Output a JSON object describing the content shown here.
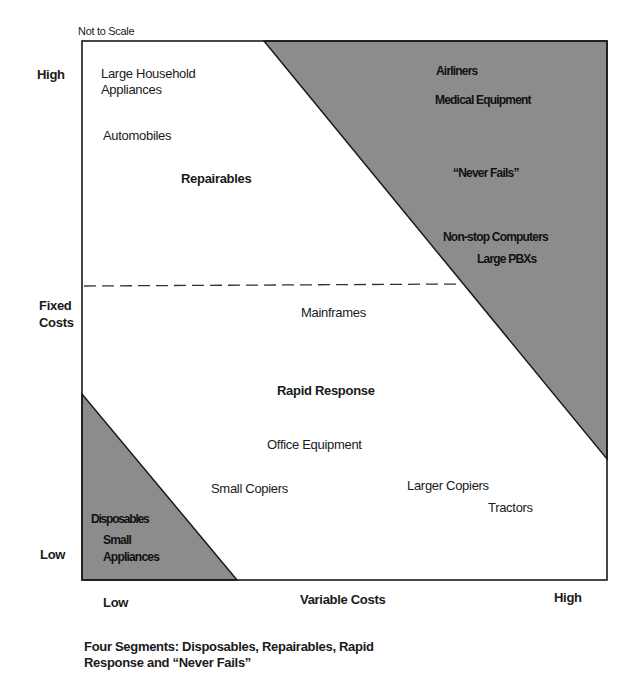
{
  "diagram": {
    "note": "Not to Scale",
    "y_axis": {
      "title_line1": "Fixed",
      "title_line2": "Costs",
      "high": "High",
      "low": "Low"
    },
    "x_axis": {
      "title": "Variable Costs",
      "low": "Low",
      "high": "High"
    },
    "colors": {
      "shaded_region": "#8c8c8c",
      "line": "#1a1a1a",
      "background": "#ffffff"
    },
    "segments": {
      "repairables": {
        "label": "Repairables",
        "items": [
          "Large Household",
          "Appliances",
          "Automobiles"
        ]
      },
      "never_fails": {
        "label": "“Never Fails”",
        "items": [
          "Airliners",
          "Medical Equipment",
          "Non-stop Computers",
          "Large PBXs"
        ]
      },
      "rapid_response": {
        "label": "Rapid Response",
        "items": [
          "Mainframes",
          "Office Equipment",
          "Small Copiers",
          "Larger Copiers",
          "Tractors"
        ]
      },
      "disposables": {
        "label": "Disposables",
        "items": [
          "Small",
          "Appliances"
        ]
      }
    },
    "caption_line1": "Four Segments: Disposables, Repairables, Rapid",
    "caption_line2": "Response and “Never Fails”"
  }
}
